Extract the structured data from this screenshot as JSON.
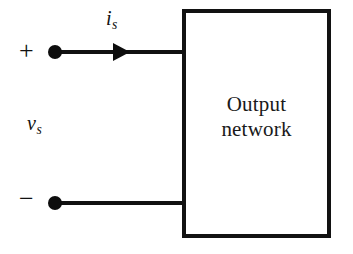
{
  "diagram": {
    "background_color": "#ffffff",
    "line_color": "#111111",
    "block": {
      "label_line1": "Output",
      "label_line2": "network",
      "border_color": "#121212",
      "fill_color": "#ffffff"
    },
    "terminals": {
      "positive_sign": "+",
      "negative_sign": "−",
      "node_color": "#0d0d0d"
    },
    "labels": {
      "current_symbol": "i",
      "current_subscript": "s",
      "voltage_symbol": "v",
      "voltage_subscript": "s"
    },
    "arrow": {
      "direction": "right",
      "meaning": "current-direction-into-output-network"
    }
  }
}
